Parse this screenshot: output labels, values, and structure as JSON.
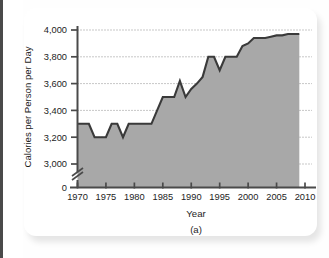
{
  "figure": {
    "panel_label": "(a)",
    "background_color": "#ffffff",
    "area_fill_color": "#a8a8a8",
    "line_color": "#3a3a3a",
    "axis_color": "#4a4a4a",
    "grid_color": "#8f8f8f",
    "text_color": "#1d1d1d"
  },
  "chart_data": {
    "type": "area",
    "title": "",
    "subtitle": "",
    "xlabel": "Year",
    "ylabel": "Calories per Person per Day",
    "annotation": "(a)",
    "grid": true,
    "grid_style": "dotted-horizontal",
    "legend": false,
    "legend_position": "none",
    "xlim": [
      1970,
      2010
    ],
    "ylim": [
      2900,
      4060
    ],
    "y_axis_break": true,
    "y_axis_break_note": "axis broken between 0 and 3,000",
    "xticks": [
      1970,
      1975,
      1980,
      1985,
      1990,
      1995,
      2000,
      2005,
      2010
    ],
    "xtick_labels": [
      "1970",
      "1975",
      "1980",
      "1985",
      "1990",
      "1995",
      "2000",
      "2005",
      "2010"
    ],
    "yticks": [
      0,
      3000,
      3200,
      3400,
      3600,
      3800,
      4000
    ],
    "ytick_labels": [
      "0",
      "3,000",
      "3,200",
      "3,400",
      "3,600",
      "3,800",
      "4,000"
    ],
    "x": [
      1970,
      1971,
      1972,
      1973,
      1974,
      1975,
      1976,
      1977,
      1978,
      1979,
      1980,
      1981,
      1982,
      1983,
      1984,
      1985,
      1986,
      1987,
      1988,
      1989,
      1990,
      1991,
      1992,
      1993,
      1994,
      1995,
      1996,
      1997,
      1998,
      1999,
      2000,
      2001,
      2002,
      2003,
      2004,
      2005,
      2006,
      2007,
      2008,
      2009
    ],
    "values": [
      3300,
      3300,
      3300,
      3200,
      3200,
      3200,
      3300,
      3300,
      3200,
      3300,
      3300,
      3300,
      3300,
      3300,
      3400,
      3500,
      3500,
      3500,
      3620,
      3500,
      3560,
      3600,
      3650,
      3800,
      3800,
      3700,
      3800,
      3800,
      3800,
      3880,
      3900,
      3940,
      3940,
      3940,
      3950,
      3960,
      3960,
      3970,
      3970,
      3970
    ],
    "series": [
      {
        "name": "Calories per Person per Day",
        "values": [
          3300,
          3300,
          3300,
          3200,
          3200,
          3200,
          3300,
          3300,
          3200,
          3300,
          3300,
          3300,
          3300,
          3300,
          3400,
          3500,
          3500,
          3500,
          3620,
          3500,
          3560,
          3600,
          3650,
          3800,
          3800,
          3700,
          3800,
          3800,
          3800,
          3880,
          3900,
          3940,
          3940,
          3940,
          3950,
          3960,
          3960,
          3970,
          3970,
          3970
        ]
      }
    ]
  }
}
